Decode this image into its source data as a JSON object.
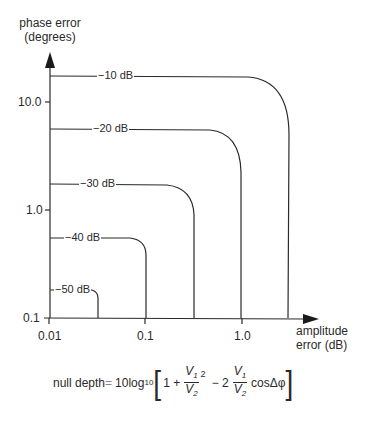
{
  "diagram": {
    "y_axis": {
      "title_line1": "phase error",
      "title_line2": "(degrees)",
      "ticks": [
        {
          "label": "10.0",
          "y": 102
        },
        {
          "label": "1.0",
          "y": 210
        },
        {
          "label": "0.1",
          "y": 318
        }
      ],
      "scale": "log"
    },
    "x_axis": {
      "title_line1": "amplitude",
      "title_line2": "error (dB)",
      "ticks": [
        {
          "label": "0.01",
          "x": 49
        },
        {
          "label": "0.1",
          "x": 145
        },
        {
          "label": "1.0",
          "x": 242
        }
      ],
      "scale": "log"
    },
    "curves": [
      {
        "label": "−10 dB",
        "phase_error_deg": 17,
        "amplitude_error_db": 3.0
      },
      {
        "label": "−20 dB",
        "phase_error_deg": 5.7,
        "amplitude_error_db": 1.0
      },
      {
        "label": "−30 dB",
        "phase_error_deg": 1.8,
        "amplitude_error_db": 0.33
      },
      {
        "label": "−40 dB",
        "phase_error_deg": 0.57,
        "amplitude_error_db": 0.1
      },
      {
        "label": "−50 dB",
        "phase_error_deg": 0.18,
        "amplitude_error_db": 0.033
      }
    ],
    "formula": {
      "lhs": "null depth",
      "equals": "=",
      "coef": "10log",
      "log_base": "10",
      "one_plus": "1 +",
      "v1": "V",
      "v1_sub": "1",
      "v2": "V",
      "v2_sub": "2",
      "square": "2",
      "minus_two": "− 2",
      "cos_term": "cosΔφ"
    }
  }
}
